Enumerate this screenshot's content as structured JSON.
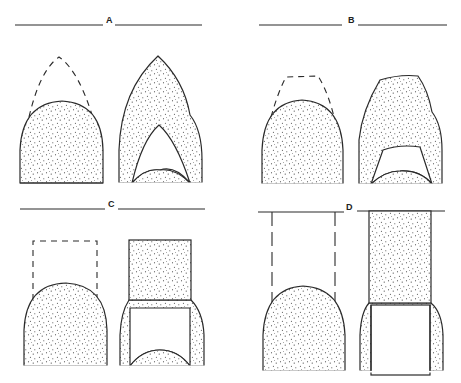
{
  "figure": {
    "panels": [
      {
        "id": "A",
        "label": "A",
        "left_figure": "Stippled rounded dome with dashed pointed-arch outline above",
        "right_figure": "Stippled pointed arch with hollow inner pointed arch and small inner dome at base"
      },
      {
        "id": "B",
        "label": "B",
        "left_figure": "Stippled rounded dome with dashed flat-topped trapezoid outline above",
        "right_figure": "Stippled flat-topped form with hollow inner trapezoid and small inner dome at base"
      },
      {
        "id": "C",
        "label": "C",
        "left_figure": "Stippled rounded dome with dashed rectangle outline above",
        "right_figure": "Stippled rectangle atop flared stippled walls enclosing hollow rectangle with small inner dome at base"
      },
      {
        "id": "D",
        "label": "D",
        "left_figure": "Stippled rounded dome with two dashed vertical lines extending up to the header line",
        "right_figure": "Stippled tall rectangle reaching header line atop flared stippled walls enclosing a hollow rectangle"
      }
    ],
    "colors": {
      "stroke": "#2a2a2a",
      "stipple_dot": "#333333",
      "background": "#ffffff"
    }
  }
}
